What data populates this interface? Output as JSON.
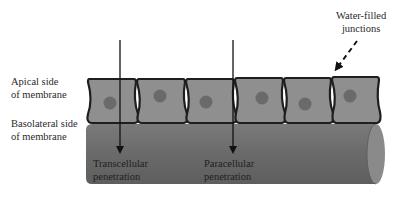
{
  "labels": {
    "apical": {
      "line1": "Apical side",
      "line2": "of membrane"
    },
    "basolateral": {
      "line1": "Basolateral side",
      "line2": "of membrane"
    },
    "transcellular": {
      "line1": "Transcellular",
      "line2": "penetration"
    },
    "paracellular": {
      "line1": "Paracellular",
      "line2": "penetration"
    },
    "junctions": {
      "line1": "Water-filled",
      "line2": "junctions"
    }
  },
  "cells": {
    "count": 6,
    "nuclei_y_offsets": [
      0,
      -6,
      0,
      -4,
      2,
      -6
    ]
  },
  "colors": {
    "cell_fill": "#8f8f8f",
    "cell_border": "#1e1e1e",
    "nucleus": "#6a6a6a",
    "cylinder_body": "#6e6e6e",
    "cylinder_cap": "#8a8a8a",
    "arrow": "#111111"
  }
}
